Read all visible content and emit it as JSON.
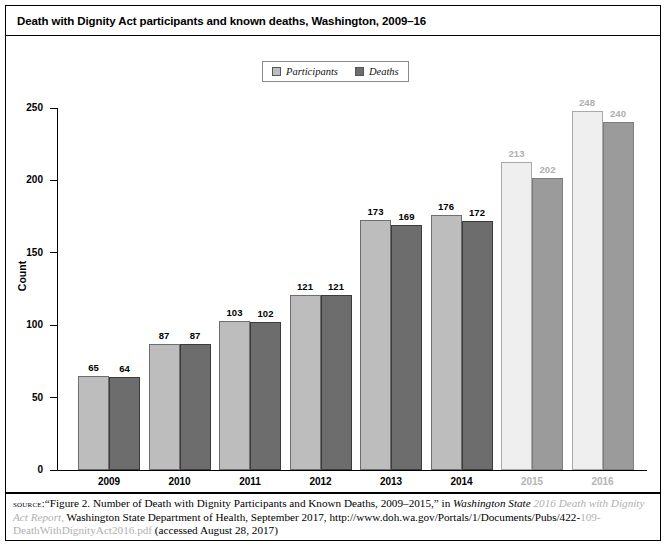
{
  "figure": {
    "title": "Death with Dignity Act participants and known deaths, Washington, 2009–16"
  },
  "legend": {
    "position": "top-center",
    "items": [
      {
        "label": "Participants",
        "color": "#bdbdbd",
        "name": "participants"
      },
      {
        "label": "Deaths",
        "color": "#6d6d6d",
        "name": "deaths"
      }
    ]
  },
  "chart_data": {
    "type": "bar",
    "title": "Death with Dignity Act participants and known deaths, Washington, 2009–16",
    "xlabel": "",
    "ylabel": "Count",
    "categories": [
      "2009",
      "2010",
      "2011",
      "2012",
      "2013",
      "2014",
      "2015",
      "2016"
    ],
    "series": [
      {
        "name": "Participants",
        "color": "#bdbdbd",
        "values": [
          65,
          87,
          103,
          121,
          173,
          176,
          213,
          248
        ]
      },
      {
        "name": "Deaths",
        "color": "#6d6d6d",
        "values": [
          64,
          87,
          102,
          121,
          169,
          172,
          202,
          240
        ]
      }
    ],
    "ylim": [
      0,
      250
    ],
    "yticks": [
      0,
      50,
      100,
      150,
      200,
      250
    ],
    "ytick_labels": [
      "0",
      "50",
      "100",
      "150",
      "200",
      "250"
    ],
    "grid": false,
    "data_labels": true,
    "faded_categories": [
      "2015",
      "2016"
    ]
  },
  "source": {
    "kicker": "source:",
    "line1_a": "“Figure 2. Number of Death with Dignity Participants and Known Deaths, 2009–2015,” in ",
    "line1_italic_clear": "Washington State ",
    "line1_italic_faded": "2016 Death with Dignity Act Report,",
    "line2_clear": "Washington State Department of Health, September 2017, http://www.doh.wa.gov/Portals/1/Documents/Pubs/422-",
    "line2_faded": "109-DeathWithDignityAct2016.pdf",
    "line3": "(accessed August 28, 2017)"
  }
}
